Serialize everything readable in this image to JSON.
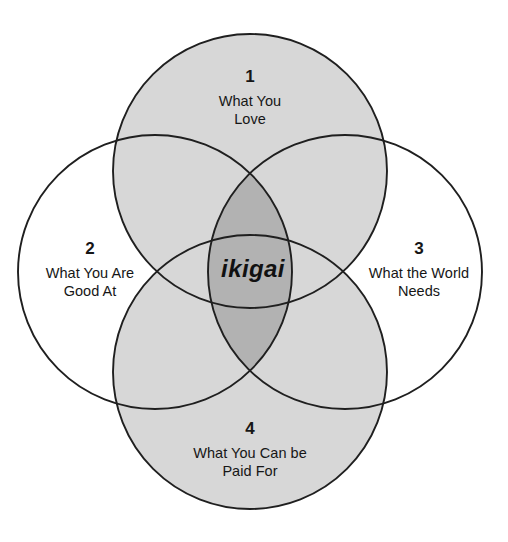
{
  "diagram": {
    "title": "ikigai",
    "type": "venn-4-circle",
    "center_label": "ikigai",
    "background_color": "#ffffff",
    "stroke_color": "#1f1f1f",
    "fill_light": "#d7d7d7",
    "fill_dark": "#b2b2b2",
    "text_color": "#161616",
    "quadrants": [
      {
        "number": "1",
        "caption": "What You\nLove",
        "position": "top",
        "filled": true,
        "icon": "circle-top"
      },
      {
        "number": "2",
        "caption": "What You Are\nGood At",
        "position": "left",
        "filled": false,
        "icon": "circle-left"
      },
      {
        "number": "3",
        "caption": "What the World\nNeeds",
        "position": "right",
        "filled": false,
        "icon": "circle-right"
      },
      {
        "number": "4",
        "caption": "What You Can be\nPaid For",
        "position": "bottom",
        "filled": true,
        "icon": "circle-bottom"
      }
    ]
  }
}
